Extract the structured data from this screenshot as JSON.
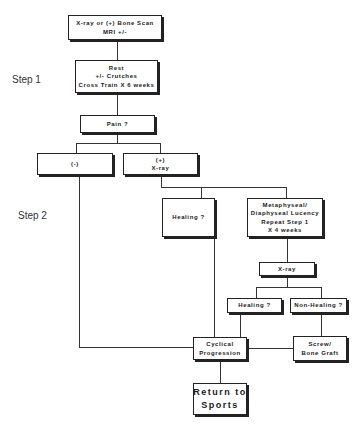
{
  "diagram": {
    "steps": [
      {
        "label": "Step 1"
      },
      {
        "label": "Step 2"
      }
    ],
    "nodes": {
      "imaging": {
        "lines": [
          "X-ray or (+) Bone Scan",
          "MRI +/-"
        ]
      },
      "rest": {
        "lines": [
          "Rest",
          "+/- Crutches",
          "Cross Train X 6 weeks"
        ]
      },
      "pain": {
        "lines": [
          "Pain ?"
        ]
      },
      "negative": {
        "lines": [
          "(-)"
        ]
      },
      "positive_xray": {
        "lines": [
          "(+)",
          "X-ray"
        ]
      },
      "healing_1": {
        "lines": [
          "Healing ?"
        ]
      },
      "lucency": {
        "lines": [
          "Metaphyseal/",
          "Diaphyseal Lucency",
          "Repeat Step 1",
          "X 4 weeks"
        ]
      },
      "xray_2": {
        "lines": [
          "X-ray"
        ]
      },
      "healing_2": {
        "lines": [
          "Healing ?"
        ]
      },
      "non_healing": {
        "lines": [
          "Non-Healing ?"
        ]
      },
      "cyclical": {
        "lines": [
          "Cyclical",
          "Progression"
        ]
      },
      "screw": {
        "lines": [
          "Screw/",
          "Bone Graft"
        ]
      },
      "return": {
        "lines": [
          "Return to",
          "Sports"
        ]
      }
    },
    "edges": [
      [
        "imaging",
        "rest"
      ],
      [
        "rest",
        "pain"
      ],
      [
        "pain",
        "negative"
      ],
      [
        "pain",
        "positive_xray"
      ],
      [
        "positive_xray",
        "healing_1"
      ],
      [
        "positive_xray",
        "lucency"
      ],
      [
        "lucency",
        "xray_2"
      ],
      [
        "xray_2",
        "healing_2"
      ],
      [
        "xray_2",
        "non_healing"
      ],
      [
        "non_healing",
        "screw"
      ],
      [
        "negative",
        "cyclical"
      ],
      [
        "healing_1",
        "cyclical"
      ],
      [
        "healing_2",
        "cyclical"
      ],
      [
        "screw",
        "cyclical"
      ],
      [
        "cyclical",
        "return"
      ]
    ]
  }
}
